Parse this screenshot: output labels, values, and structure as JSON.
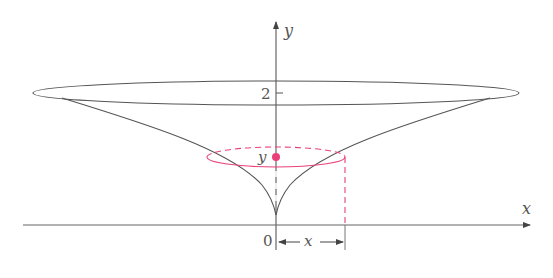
{
  "figure": {
    "colors": {
      "axis": "#555555",
      "curve": "#555555",
      "highlight": "#e8407a"
    },
    "labels": {
      "y_axis": "y",
      "x_axis": "x",
      "origin": "0",
      "tick_2": "2",
      "section_height": "y",
      "radius": "x"
    }
  }
}
